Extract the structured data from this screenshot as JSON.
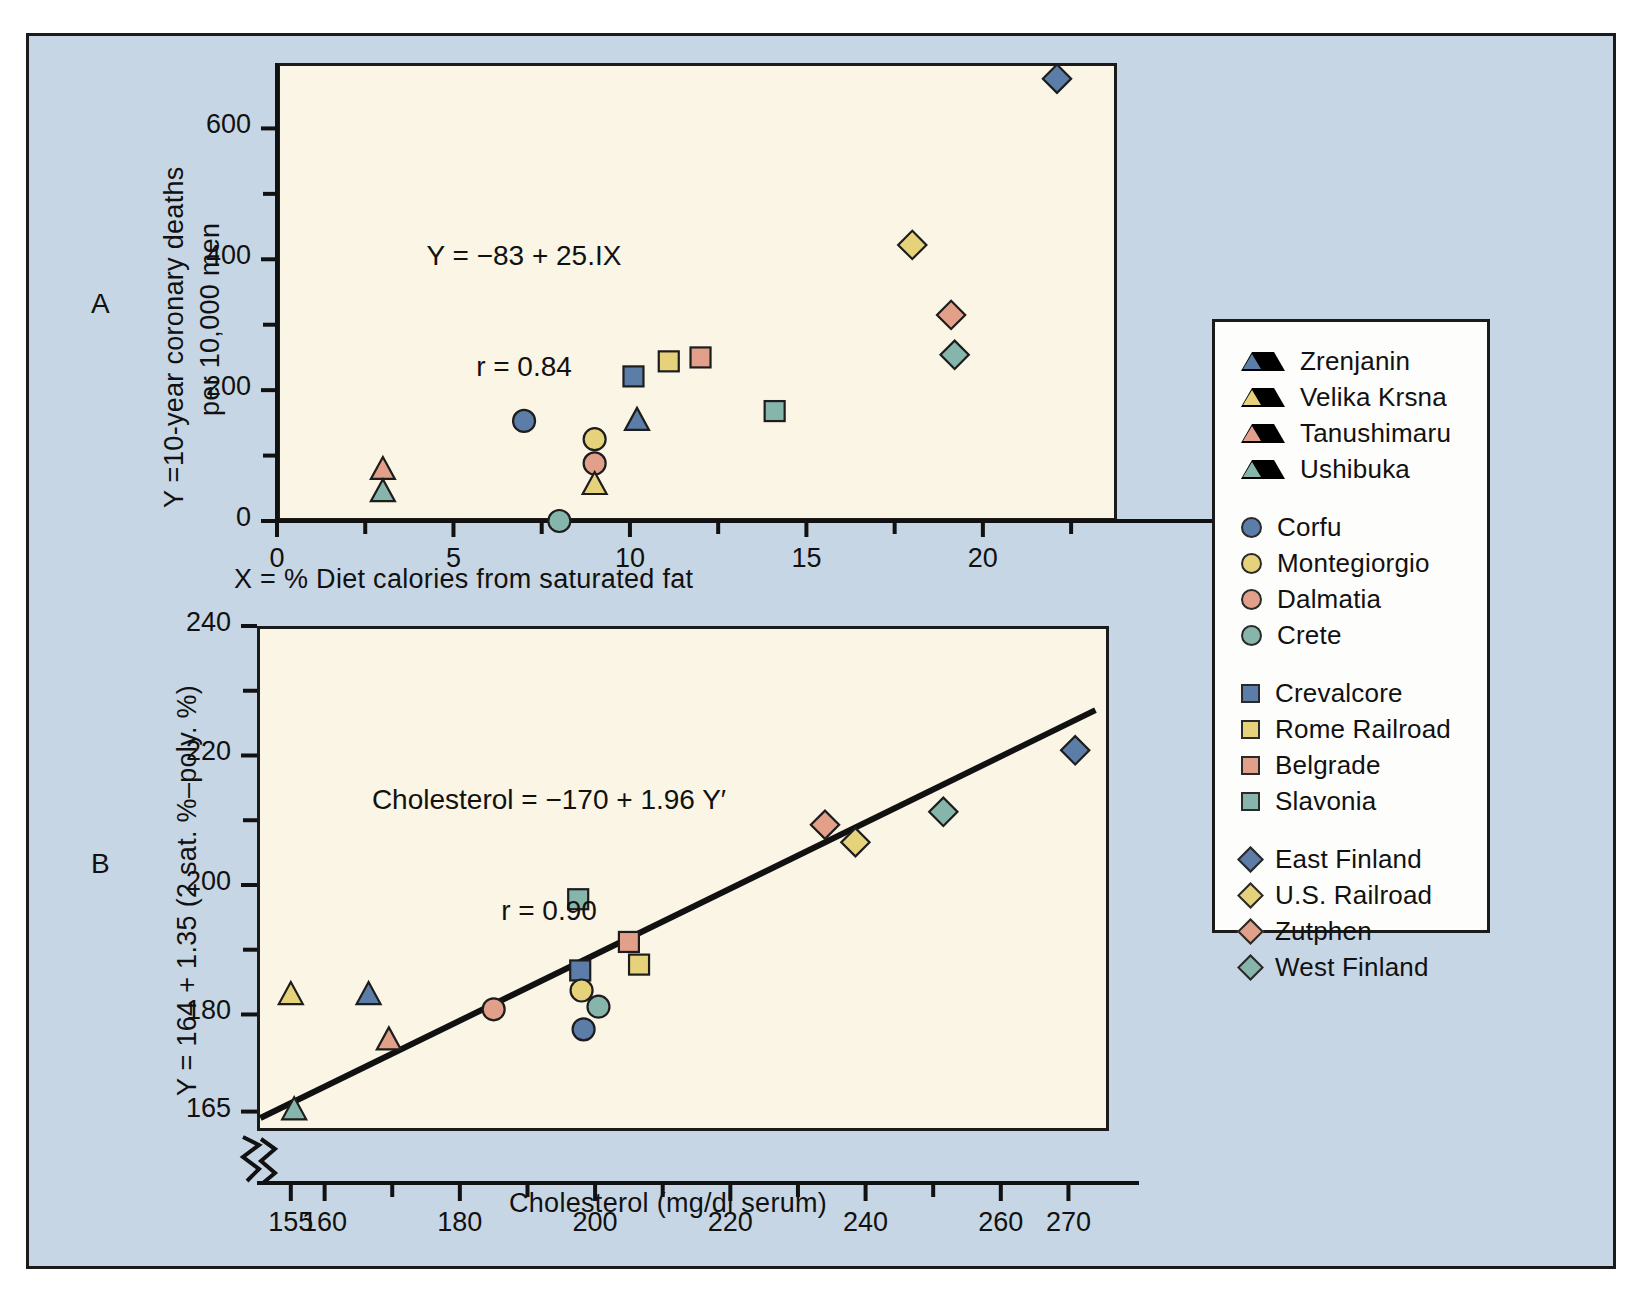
{
  "figure": {
    "background_color": "#c7d6e4",
    "plot_background_color": "#faf5e4",
    "panel_a_label": "A",
    "panel_b_label": "B"
  },
  "legend": {
    "groups": [
      {
        "shape": "triangle",
        "items": [
          {
            "label": "Zrenjanin",
            "color": "#5b7da8"
          },
          {
            "label": "Velika Krsna",
            "color": "#e7d27c"
          },
          {
            "label": "Tanushimaru",
            "color": "#e2a08a"
          },
          {
            "label": "Ushibuka",
            "color": "#86b5ab"
          }
        ]
      },
      {
        "shape": "circle",
        "items": [
          {
            "label": "Corfu",
            "color": "#5b7da8"
          },
          {
            "label": "Montegiorgio",
            "color": "#e7d27c"
          },
          {
            "label": "Dalmatia",
            "color": "#e2a08a"
          },
          {
            "label": "Crete",
            "color": "#86b5ab"
          }
        ]
      },
      {
        "shape": "square",
        "items": [
          {
            "label": "Crevalcore",
            "color": "#5b7da8"
          },
          {
            "label": "Rome Railroad",
            "color": "#e7d27c"
          },
          {
            "label": "Belgrade",
            "color": "#e2a08a"
          },
          {
            "label": "Slavonia",
            "color": "#86b5ab"
          }
        ]
      },
      {
        "shape": "diamond",
        "items": [
          {
            "label": "East Finland",
            "color": "#5b7da8"
          },
          {
            "label": "U.S. Railroad",
            "color": "#e7d27c"
          },
          {
            "label": "Zutphen",
            "color": "#e2a08a"
          },
          {
            "label": "West Finland",
            "color": "#86b5ab"
          }
        ]
      }
    ]
  },
  "chart_data": [
    {
      "id": "panel_a",
      "type": "scatter",
      "title": "",
      "xlabel": "X = % Diet calories from saturated fat",
      "ylabel": "Y = 10-year coronary deaths\nper 10,000 men",
      "annotation_line1": "Y = −83 + 25.IX",
      "annotation_line2": "r = 0.84",
      "xlim": [
        0,
        23.8
      ],
      "ylim": [
        0,
        700
      ],
      "xticks": [
        0,
        5,
        10,
        15,
        20
      ],
      "xticklabels": [
        "0",
        "5",
        "10",
        "15",
        "20"
      ],
      "xminorticks": [
        2.5,
        7.5,
        12.5,
        17.5,
        22.5
      ],
      "yticks": [
        0,
        200,
        400,
        600
      ],
      "yticklabels": [
        "0",
        "200",
        "400",
        "600"
      ],
      "yminorticks": [
        100,
        300,
        500
      ],
      "grid": false,
      "points": [
        {
          "label": "Tanushimaru",
          "shape": "triangle",
          "color": "#e2a08a",
          "x": 3.0,
          "y": 78
        },
        {
          "label": "Ushibuka",
          "shape": "triangle",
          "color": "#86b5ab",
          "x": 3.0,
          "y": 44
        },
        {
          "label": "Corfu",
          "shape": "circle",
          "color": "#5b7da8",
          "x": 7.0,
          "y": 153
        },
        {
          "label": "Crete",
          "shape": "circle",
          "color": "#86b5ab",
          "x": 8.0,
          "y": 0
        },
        {
          "label": "Montegiorgio",
          "shape": "circle",
          "color": "#e7d27c",
          "x": 9.0,
          "y": 125
        },
        {
          "label": "Dalmatia",
          "shape": "circle",
          "color": "#e2a08a",
          "x": 9.0,
          "y": 88
        },
        {
          "label": "Velika Krsna",
          "shape": "triangle",
          "color": "#e7d27c",
          "x": 9.0,
          "y": 55
        },
        {
          "label": "Crevalcore",
          "shape": "square",
          "color": "#5b7da8",
          "x": 10.1,
          "y": 221
        },
        {
          "label": "Zrenjanin",
          "shape": "triangle",
          "color": "#5b7da8",
          "x": 10.2,
          "y": 153
        },
        {
          "label": "Rome Railroad",
          "shape": "square",
          "color": "#e7d27c",
          "x": 11.1,
          "y": 244
        },
        {
          "label": "Belgrade",
          "shape": "square",
          "color": "#e2a08a",
          "x": 12.0,
          "y": 250
        },
        {
          "label": "Slavonia",
          "shape": "square",
          "color": "#86b5ab",
          "x": 14.1,
          "y": 168
        },
        {
          "label": "U.S. Railroad",
          "shape": "diamond",
          "color": "#e7d27c",
          "x": 18.0,
          "y": 422
        },
        {
          "label": "Zutphen",
          "shape": "diamond",
          "color": "#e2a08a",
          "x": 19.1,
          "y": 315
        },
        {
          "label": "West Finland",
          "shape": "diamond",
          "color": "#86b5ab",
          "x": 19.2,
          "y": 254
        },
        {
          "label": "East Finland",
          "shape": "diamond",
          "color": "#5b7da8",
          "x": 22.1,
          "y": 676
        }
      ]
    },
    {
      "id": "panel_b",
      "type": "scatter",
      "title": "",
      "xlabel": "Cholesterol (mg/dl serum)",
      "ylabel": "Y = 164 + 1.35 (2 sat. %–poly. %)",
      "annotation_line1": "Cholesterol = −170 + 1.96 Y′",
      "annotation_line2": "r = 0.90",
      "xlim": [
        150,
        276
      ],
      "ylim": [
        162,
        240
      ],
      "axis_break": true,
      "xticks": [
        155,
        160,
        180,
        200,
        220,
        240,
        260,
        270
      ],
      "xticklabels": [
        "155",
        "160",
        "180",
        "200",
        "220",
        "240",
        "260",
        "270"
      ],
      "xminorticks": [
        170,
        190,
        210,
        230,
        250
      ],
      "yticks": [
        165,
        180,
        200,
        220,
        240
      ],
      "yticklabels": [
        "165",
        "180",
        "200",
        "220",
        "240"
      ],
      "yminorticks": [
        190,
        210,
        230
      ],
      "grid": false,
      "trendline": {
        "x1": 150.5,
        "y1": 164.0,
        "x2": 274.0,
        "y2": 227.0,
        "color": "#111111"
      },
      "points": [
        {
          "label": "Ushibuka",
          "shape": "triangle",
          "color": "#86b5ab",
          "x": 155.5,
          "y": 165.2
        },
        {
          "label": "Velika Krsna",
          "shape": "triangle",
          "color": "#e7d27c",
          "x": 155.0,
          "y": 183.0
        },
        {
          "label": "Zrenjanin",
          "shape": "triangle",
          "color": "#5b7da8",
          "x": 166.5,
          "y": 183.0
        },
        {
          "label": "Tanushimaru",
          "shape": "triangle",
          "color": "#e2a08a",
          "x": 169.5,
          "y": 176.0
        },
        {
          "label": "Dalmatia",
          "shape": "circle",
          "color": "#e2a08a",
          "x": 185.0,
          "y": 180.8
        },
        {
          "label": "Slavonia",
          "shape": "square",
          "color": "#86b5ab",
          "x": 197.5,
          "y": 197.8
        },
        {
          "label": "Crevalcore",
          "shape": "square",
          "color": "#5b7da8",
          "x": 197.8,
          "y": 186.8
        },
        {
          "label": "Montegiorgio",
          "shape": "circle",
          "color": "#e7d27c",
          "x": 198.0,
          "y": 183.7
        },
        {
          "label": "Corfu",
          "shape": "circle",
          "color": "#5b7da8",
          "x": 198.3,
          "y": 177.7
        },
        {
          "label": "Crete",
          "shape": "circle",
          "color": "#86b5ab",
          "x": 200.5,
          "y": 181.2
        },
        {
          "label": "Belgrade",
          "shape": "square",
          "color": "#e2a08a",
          "x": 205.0,
          "y": 191.2
        },
        {
          "label": "Rome Railroad",
          "shape": "square",
          "color": "#e7d27c",
          "x": 206.5,
          "y": 187.7
        },
        {
          "label": "Zutphen",
          "shape": "diamond",
          "color": "#e2a08a",
          "x": 234.0,
          "y": 209.3
        },
        {
          "label": "U.S. Railroad",
          "shape": "diamond",
          "color": "#e7d27c",
          "x": 238.5,
          "y": 206.6
        },
        {
          "label": "West Finland",
          "shape": "diamond",
          "color": "#86b5ab",
          "x": 251.5,
          "y": 211.3
        },
        {
          "label": "East Finland",
          "shape": "diamond",
          "color": "#5b7da8",
          "x": 271.0,
          "y": 220.8
        }
      ]
    }
  ]
}
